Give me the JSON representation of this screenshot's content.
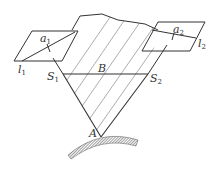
{
  "diagram": {
    "type": "geometry",
    "labels": {
      "a1": {
        "main": "a",
        "sub": "1"
      },
      "a2": {
        "main": "a",
        "sub": "2"
      },
      "l1": {
        "main": "l",
        "sub": "1"
      },
      "l2": {
        "main": "l",
        "sub": "2"
      },
      "S1": {
        "main": "S",
        "sub": "1"
      },
      "S2": {
        "main": "S",
        "sub": "2"
      },
      "B": "B",
      "A": "A"
    },
    "colors": {
      "line": "#333333",
      "hatch": "#888888",
      "ground": "#555555"
    }
  }
}
